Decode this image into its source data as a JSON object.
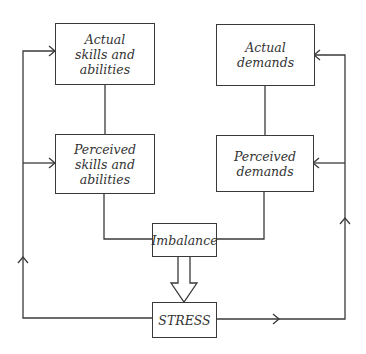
{
  "diagram": {
    "type": "flowchart",
    "nodes": {
      "actual_skills": {
        "label": "Actual\nskills and\nabilities"
      },
      "perceived_skills": {
        "label": "Perceived\nskills and\nabilities"
      },
      "actual_demands": {
        "label": "Actual\ndemands"
      },
      "perceived_demands": {
        "label": "Perceived\ndemands"
      },
      "imbalance": {
        "label": "Imbalance"
      },
      "stress": {
        "label": "STRESS"
      }
    },
    "edges": [
      {
        "from": "actual_skills",
        "to": "perceived_skills",
        "style": "line"
      },
      {
        "from": "actual_demands",
        "to": "perceived_demands",
        "style": "line"
      },
      {
        "from": "perceived_skills",
        "to": "imbalance",
        "style": "line"
      },
      {
        "from": "perceived_demands",
        "to": "imbalance",
        "style": "line"
      },
      {
        "from": "imbalance",
        "to": "stress",
        "style": "hollow-arrow"
      },
      {
        "from": "stress",
        "to": "actual_skills",
        "style": "feedback-arrow",
        "side": "left"
      },
      {
        "from": "stress",
        "to": "perceived_skills",
        "style": "feedback-arrow",
        "side": "left"
      },
      {
        "from": "stress",
        "to": "actual_demands",
        "style": "feedback-arrow",
        "side": "right"
      },
      {
        "from": "stress",
        "to": "perceived_demands",
        "style": "feedback-arrow",
        "side": "right"
      }
    ],
    "colors": {
      "line": "#3a3a3a",
      "text": "#333333",
      "background": "#ffffff"
    }
  }
}
